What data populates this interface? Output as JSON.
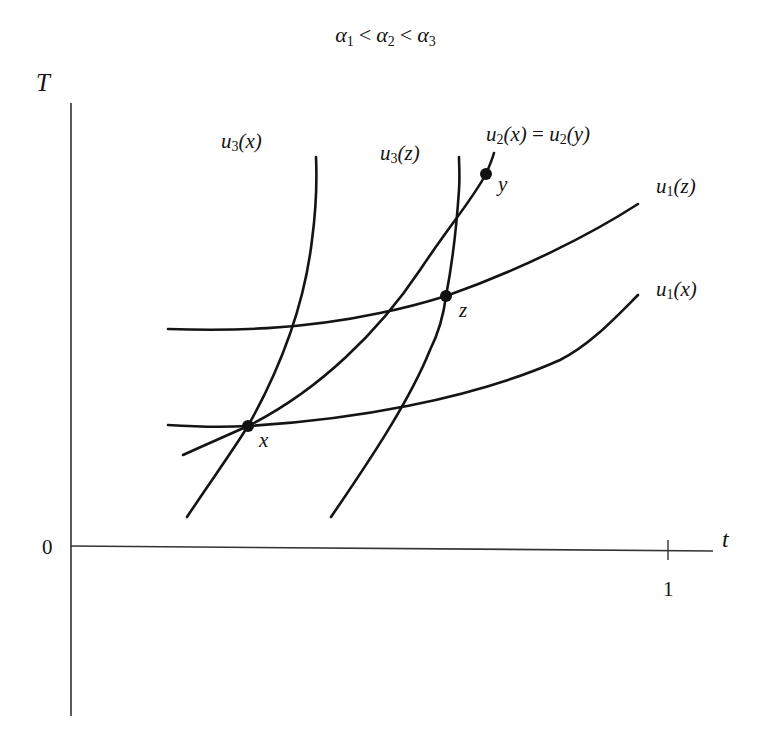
{
  "title": {
    "parts": [
      {
        "sym": "α",
        "sub": "1"
      },
      {
        "op": "<"
      },
      {
        "sym": "α",
        "sub": "2"
      },
      {
        "op": "<"
      },
      {
        "sym": "α",
        "sub": "3"
      }
    ]
  },
  "axes": {
    "y_label": "T",
    "x_label": "t",
    "origin_label": "0",
    "x_tick_label": "1"
  },
  "curves": {
    "u3x": {
      "fn": "u",
      "sub": "3",
      "arg": "(x)"
    },
    "u3z": {
      "fn": "u",
      "sub": "3",
      "arg": "(z)"
    },
    "u2": {
      "fn": "u",
      "sub": "2",
      "arg": "(x)",
      "eq": " = ",
      "fn2": "u",
      "sub2": "2",
      "arg2": "(y)"
    },
    "u1z": {
      "fn": "u",
      "sub": "1",
      "arg": "(z)"
    },
    "u1x": {
      "fn": "u",
      "sub": "1",
      "arg": "(x)"
    }
  },
  "points": {
    "x": "x",
    "y": "y",
    "z": "z"
  },
  "colors": {
    "ink": "#141414",
    "axis": "#2a2a2a",
    "background": "#ffffff"
  }
}
